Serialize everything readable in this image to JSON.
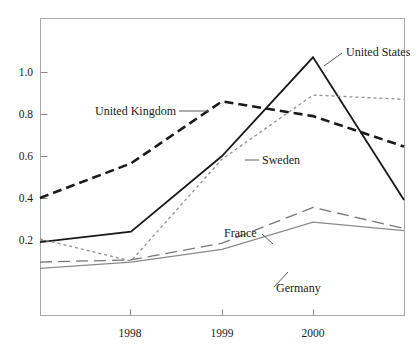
{
  "chart_data": {
    "type": "line",
    "title": "",
    "subtitle": "",
    "xlabel": "",
    "ylabel": "",
    "x": [
      1997.0,
      1998,
      1999,
      2000,
      2001.0
    ],
    "xtick_labels": [
      "1998",
      "1999",
      "2000"
    ],
    "xtick_values": [
      1998,
      1999,
      2000
    ],
    "ytick_labels": [
      "0.2",
      "0.4",
      "0.6",
      "0.8",
      "1.0"
    ],
    "ytick_values": [
      0.2,
      0.4,
      0.6,
      0.8,
      1.0
    ],
    "xlim": [
      1997.0,
      2001.0
    ],
    "ylim": [
      0.0,
      1.18
    ],
    "grid": false,
    "legend": "inline-annotations",
    "series": [
      {
        "name": "United States",
        "style": "solid",
        "color": "#1a1a1a",
        "width": 1.8,
        "values": [
          0.19,
          0.24,
          0.6,
          1.07,
          0.39
        ],
        "label_x": 2000.35,
        "label_y": 1.03
      },
      {
        "name": "United Kingdom",
        "style": "dashed-heavy",
        "color": "#1a1a1a",
        "width": 2.6,
        "values": [
          0.4,
          0.565,
          0.86,
          0.79,
          0.645
        ],
        "label_x": 1997.55,
        "label_y": 0.805
      },
      {
        "name": "Sweden",
        "style": "dotted",
        "color": "#8f8f8f",
        "width": 1.3,
        "values": [
          0.205,
          0.1,
          0.585,
          0.89,
          0.87
        ],
        "label_x": 1999.3,
        "label_y": 0.585
      },
      {
        "name": "France",
        "style": "long-dash",
        "color": "#777777",
        "width": 1.3,
        "values": [
          0.095,
          0.105,
          0.185,
          0.355,
          0.255
        ],
        "label_x": 1999.05,
        "label_y": 0.3
      },
      {
        "name": "Germany",
        "style": "solid-thin",
        "color": "#8a8a8a",
        "width": 1.3,
        "values": [
          0.065,
          0.095,
          0.155,
          0.285,
          0.245
        ],
        "label_x": 1999.45,
        "label_y": 0.135
      }
    ]
  },
  "axis": {
    "frame_color": "#aaaaaa",
    "tick_color": "#8a8a8a"
  }
}
